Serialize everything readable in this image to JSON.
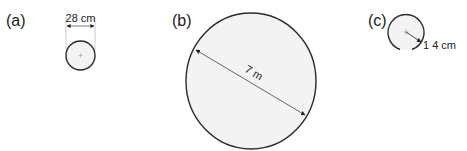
{
  "figures": [
    {
      "label": "(a)",
      "measure_type": "diameter",
      "measure_text": "28 cm"
    },
    {
      "label": "(b)",
      "measure_type": "diameter",
      "measure_text": "7 m"
    },
    {
      "label": "(c)",
      "measure_type": "radius",
      "measure_text": "1 4 cm"
    }
  ],
  "colors": {
    "circle_fill": "#f3f3f3",
    "circle_stroke": "#2a2a2a",
    "dimension_line": "#555555",
    "text": "#1a1a1a"
  }
}
